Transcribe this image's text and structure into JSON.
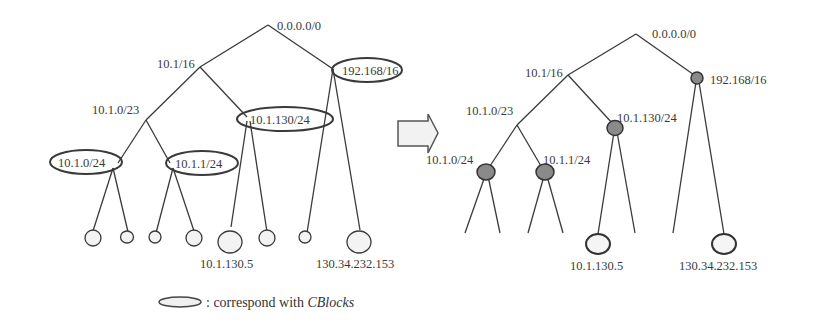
{
  "left_tree": {
    "root": "0.0.0.0/0",
    "n_10_1_16": "10.1/16",
    "n_192_168_16": "192.168/16",
    "n_10_1_0_23": "10.1.0/23",
    "n_10_1_130_24": "10.1.130/24",
    "n_10_1_0_24": "10.1.0/24",
    "n_10_1_1_24": "10.1.1/24",
    "leaf_10_1_130_5": "10.1.130.5",
    "leaf_130_34_232_153": "130.34.232.153"
  },
  "right_tree": {
    "root": "0.0.0.0/0",
    "n_10_1_16": "10.1/16",
    "n_192_168_16": "192.168/16",
    "n_10_1_0_23": "10.1.0/23",
    "n_10_1_130_24": "10.1.130/24",
    "n_10_1_0_24": "10.1.0/24",
    "n_10_1_1_24": "10.1.1/24",
    "leaf_10_1_130_5": "10.1.130.5",
    "leaf_130_34_232_153": "130.34.232.153"
  },
  "arrow": "transform-arrow",
  "legend": {
    "text": ": correspond with ",
    "emphasis": "CBlocks"
  }
}
